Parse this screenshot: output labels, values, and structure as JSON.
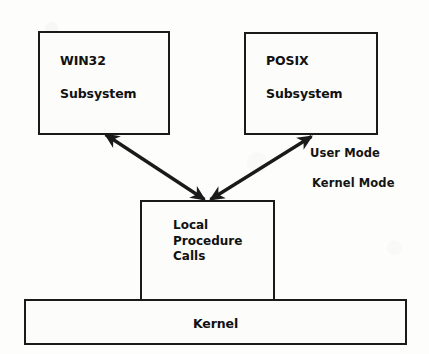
{
  "diagram": {
    "background_color": "#fdfdfc",
    "line_color": "#1a1a1a",
    "text_color": "#111111",
    "boxes": {
      "win32": {
        "line1": "WIN32",
        "line2": "Subsystem",
        "x": 38,
        "y": 31,
        "w": 132,
        "h": 104
      },
      "posix": {
        "line1": "POSIX",
        "line2": "Subsystem",
        "x": 244,
        "y": 32,
        "w": 134,
        "h": 103
      },
      "lpc": {
        "line1": "Local",
        "line2": "Procedure",
        "line3": "Calls",
        "x": 140,
        "y": 200,
        "w": 135,
        "h": 101
      },
      "kernel": {
        "label": "Kernel",
        "x": 24,
        "y": 299,
        "w": 383,
        "h": 46
      }
    },
    "labels": {
      "user_mode": "User Mode",
      "kernel_mode": "Kernel Mode"
    },
    "connectors": [
      {
        "name": "win32-to-lpc",
        "from": "win32",
        "to": "lpc",
        "style": "double-headed-arrow"
      },
      {
        "name": "posix-to-lpc",
        "from": "posix",
        "to": "lpc",
        "style": "double-headed-arrow"
      }
    ]
  }
}
